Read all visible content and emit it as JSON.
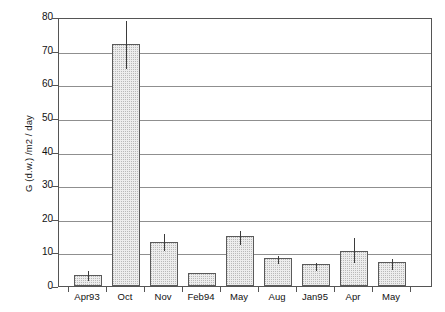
{
  "chart_data": {
    "type": "bar",
    "title": "",
    "xlabel": "",
    "ylabel": "G (d.w.) /m2 / day",
    "categories": [
      "Apr93",
      "Oct",
      "Nov",
      "Feb94",
      "May",
      "Aug",
      "Jan95",
      "Apr",
      "May"
    ],
    "values": [
      3.2,
      72.0,
      13.0,
      4.0,
      14.8,
      8.4,
      6.4,
      10.5,
      7.0
    ],
    "error_upper": [
      5.0,
      79.5,
      16.0,
      4.0,
      17.0,
      9.5,
      7.5,
      15.0,
      8.6
    ],
    "error_lower": [
      2.0,
      65.0,
      11.0,
      4.0,
      12.8,
      7.2,
      5.2,
      7.5,
      5.5
    ],
    "ylim": [
      0,
      80
    ],
    "yticks": [
      0,
      10,
      20,
      30,
      40,
      50,
      60,
      70,
      80
    ],
    "ytick_labels": [
      "0",
      "10",
      "20",
      "30",
      "40",
      "50",
      "60",
      "70",
      "80"
    ],
    "grid": true,
    "legend": null,
    "bar_fill": "#ededed",
    "bar_edge": "#5a5a5a",
    "grid_color": "#8f8f8f",
    "axis_color": "#555555"
  }
}
